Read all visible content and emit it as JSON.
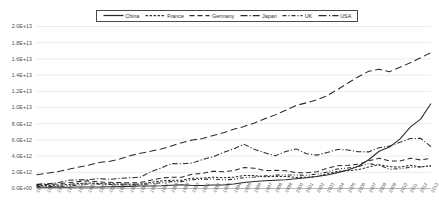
{
  "chart_data": {
    "type": "line",
    "title": "",
    "subtitle": "",
    "xlabel": "",
    "ylabel": "",
    "grid": true,
    "legend_position": "top-center",
    "ylim": [
      0,
      20000000000000
    ],
    "ytick_labels": [
      "2.0E+13",
      "1.8E+13",
      "1.6E+13",
      "1.4E+13",
      "1.2E+13",
      "1.0E+13",
      "8.0E+12",
      "6.0E+12",
      "4.0E+12",
      "2.0E+12",
      "0.0E+00"
    ],
    "ytick_values": [
      20000000000000,
      18000000000000,
      16000000000000,
      14000000000000,
      12000000000000,
      10000000000000,
      8000000000000,
      6000000000000,
      4000000000000,
      2000000000000,
      0
    ],
    "x": [
      1975,
      1976,
      1977,
      1978,
      1979,
      1980,
      1981,
      1982,
      1983,
      1984,
      1985,
      1986,
      1987,
      1988,
      1989,
      1990,
      1991,
      1992,
      1993,
      1994,
      1995,
      1996,
      1997,
      1998,
      1999,
      2000,
      2001,
      2002,
      2003,
      2004,
      2005,
      2006,
      2007,
      2008,
      2009,
      2010,
      2011,
      2012,
      2013
    ],
    "categories": [
      "1975",
      "1976",
      "1977",
      "1978",
      "1979",
      "1980",
      "1981",
      "1982",
      "1983",
      "1984",
      "1985",
      "1986",
      "1987",
      "1988",
      "1989",
      "1990",
      "1991",
      "1992",
      "1993",
      "1994",
      "1995",
      "1996",
      "1997",
      "1998",
      "1999",
      "2000",
      "2001",
      "2002",
      "2003",
      "2004",
      "2005",
      "2006",
      "2007",
      "2008",
      "2009",
      "2010",
      "2011",
      "2012",
      "2013"
    ],
    "series": [
      {
        "name": "China",
        "style": "solid",
        "color": "#2b2b2b",
        "values": [
          163000000000.0,
          154000000000.0,
          175000000000.0,
          150000000000.0,
          178000000000.0,
          191000000000.0,
          196000000000.0,
          205000000000.0,
          230000000000.0,
          260000000000.0,
          309000000000.0,
          300000000000.0,
          327000000000.0,
          410000000000.0,
          459000000000.0,
          361000000000.0,
          383000000000.0,
          427000000000.0,
          445000000000.0,
          564000000000.0,
          734000000000.0,
          863000000000.0,
          962000000000.0,
          1030000000000.0,
          1090000000000.0,
          1210000000000.0,
          1340000000000.0,
          1470000000000.0,
          1660000000000.0,
          1960000000000.0,
          2290000000000.0,
          2750000000000.0,
          3550000000000.0,
          4600000000000.0,
          5110000000000.0,
          6100000000000.0,
          7570000000000.0,
          8560000000000.0,
          10500000000000.0
        ]
      },
      {
        "name": "France",
        "style": "dashed-short",
        "color": "#2b2b2b",
        "values": [
          360000000000.0,
          375000000000.0,
          406000000000.0,
          489000000000.0,
          600000000000.0,
          691000000000.0,
          612000000000.0,
          576000000000.0,
          550000000000.0,
          520000000000.0,
          544000000000.0,
          755000000000.0,
          928000000000.0,
          1010000000000.0,
          1030000000000.0,
          1270000000000.0,
          1270000000000.0,
          1400000000000.0,
          1330000000000.0,
          1400000000000.0,
          1600000000000.0,
          1600000000000.0,
          1450000000000.0,
          1500000000000.0,
          1490000000000.0,
          1370000000000.0,
          1380000000000.0,
          1490000000000.0,
          1840000000000.0,
          2120000000000.0,
          2200000000000.0,
          2320000000000.0,
          2660000000000.0,
          2930000000000.0,
          2690000000000.0,
          2650000000000.0,
          2860000000000.0,
          2680000000000.0,
          2810000000000.0
        ]
      },
      {
        "name": "Germany",
        "style": "dashed-medium",
        "color": "#2b2b2b",
        "values": [
          476000000000.0,
          500000000000.0,
          563000000000.0,
          703000000000.0,
          850000000000.0,
          947000000000.0,
          800000000000.0,
          760000000000.0,
          729000000000.0,
          693000000000.0,
          730000000000.0,
          1030000000000.0,
          1280000000000.0,
          1400000000000.0,
          1400000000000.0,
          1770000000000.0,
          1870000000000.0,
          2130000000000.0,
          2070000000000.0,
          2210000000000.0,
          2590000000000.0,
          2500000000000.0,
          2220000000000.0,
          2240000000000.0,
          2200000000000.0,
          1950000000000.0,
          1950000000000.0,
          2080000000000.0,
          2510000000000.0,
          2820000000000.0,
          2860000000000.0,
          2990000000000.0,
          3420000000000.0,
          3740000000000.0,
          3400000000000.0,
          3400000000000.0,
          3740000000000.0,
          3530000000000.0,
          3730000000000.0
        ]
      },
      {
        "name": "Japan",
        "style": "dash-dot",
        "color": "#2b2b2b",
        "values": [
          516000000000.0,
          580000000000.0,
          704000000000.0,
          1010000000000.0,
          1060000000000.0,
          1100000000000.0,
          1220000000000.0,
          1130000000000.0,
          1240000000000.0,
          1320000000000.0,
          1400000000000.0,
          2070000000000.0,
          2530000000000.0,
          3070000000000.0,
          3050000000000.0,
          3140000000000.0,
          3580000000000.0,
          3910000000000.0,
          4450000000000.0,
          4910000000000.0,
          5450000000000.0,
          4830000000000.0,
          4420000000000.0,
          4030000000000.0,
          4560000000000.0,
          4890000000000.0,
          4300000000000.0,
          4120000000000.0,
          4450000000000.0,
          4820000000000.0,
          4760000000000.0,
          4530000000000.0,
          4520000000000.0,
          5040000000000.0,
          5230000000000.0,
          5700000000000.0,
          6160000000000.0,
          6200000000000.0,
          5160000000000.0
        ]
      },
      {
        "name": "UK",
        "style": "dash-dot-dot",
        "color": "#2b2b2b",
        "values": [
          241000000000.0,
          232000000000.0,
          260000000000.0,
          335000000000.0,
          428000000000.0,
          565000000000.0,
          540000000000.0,
          492000000000.0,
          465000000000.0,
          448000000000.0,
          472000000000.0,
          579000000000.0,
          704000000000.0,
          850000000000.0,
          852000000000.0,
          1090000000000.0,
          1130000000000.0,
          1180000000000.0,
          1060000000000.0,
          1140000000000.0,
          1340000000000.0,
          1420000000000.0,
          1560000000000.0,
          1650000000000.0,
          1680000000000.0,
          1660000000000.0,
          1640000000000.0,
          1780000000000.0,
          2050000000000.0,
          2420000000000.0,
          2530000000000.0,
          2710000000000.0,
          3070000000000.0,
          2890000000000.0,
          2380000000000.0,
          2440000000000.0,
          2620000000000.0,
          2660000000000.0,
          2790000000000.0
        ]
      },
      {
        "name": "USA",
        "style": "long-dash",
        "color": "#2b2b2b",
        "values": [
          1690000000000.0,
          1880000000000.0,
          2080000000000.0,
          2350000000000.0,
          2630000000000.0,
          2860000000000.0,
          3210000000000.0,
          3340000000000.0,
          3630000000000.0,
          4040000000000.0,
          4350000000000.0,
          4590000000000.0,
          4870000000000.0,
          5250000000000.0,
          5660000000000.0,
          5980000000000.0,
          6170000000000.0,
          6540000000000.0,
          6880000000000.0,
          7310000000000.0,
          7660000000000.0,
          8100000000000.0,
          8610000000000.0,
          9090000000000.0,
          9660000000000.0,
          10250000000000.0,
          10580000000000.0,
          10940000000000.0,
          11460000000000.0,
          12210000000000.0,
          13030000000000.0,
          13800000000000.0,
          14470000000000.0,
          14720000000000.0,
          14420000000000.0,
          14960000000000.0,
          15520000000000.0,
          16150000000000.0,
          16770000000000.0
        ]
      }
    ]
  },
  "legend": {
    "items": [
      {
        "label": "China"
      },
      {
        "label": "France"
      },
      {
        "label": "Germany"
      },
      {
        "label": "Japan"
      },
      {
        "label": "UK"
      },
      {
        "label": "USA"
      }
    ]
  }
}
